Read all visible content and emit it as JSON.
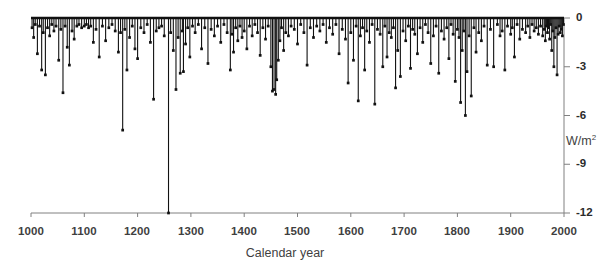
{
  "chart_data": {
    "type": "bar",
    "title": "",
    "subtitle": "",
    "xlabel": "Calendar year",
    "ylabel": "W/m²",
    "xlim": [
      1000,
      2000
    ],
    "ylim": [
      -12,
      0
    ],
    "xticks": [
      1000,
      1100,
      1200,
      1300,
      1400,
      1500,
      1600,
      1700,
      1800,
      1900,
      2000
    ],
    "xtick_labels": [
      "1000",
      "1100",
      "1200",
      "1300",
      "1400",
      "1500",
      "1600",
      "1700",
      "1800",
      "1900",
      "2000"
    ],
    "yticks": [
      0,
      -3,
      -6,
      -9,
      -12
    ],
    "ytick_labels": [
      "0",
      "-3",
      "-6",
      "-9",
      "-12"
    ],
    "grid": false,
    "legend": null,
    "series_name": "Volcanic radiative forcing",
    "marker": "square",
    "marker_color": "#111111",
    "line_color": "#111111",
    "axis_color": "#808080",
    "baseline": 0,
    "x": [
      1002,
      1005,
      1008,
      1012,
      1016,
      1020,
      1023,
      1027,
      1031,
      1035,
      1039,
      1043,
      1047,
      1052,
      1056,
      1060,
      1064,
      1068,
      1072,
      1077,
      1081,
      1086,
      1090,
      1095,
      1100,
      1104,
      1108,
      1112,
      1117,
      1122,
      1128,
      1134,
      1140,
      1146,
      1152,
      1158,
      1164,
      1168,
      1172,
      1176,
      1180,
      1185,
      1190,
      1195,
      1200,
      1206,
      1212,
      1218,
      1224,
      1230,
      1235,
      1240,
      1245,
      1250,
      1258,
      1262,
      1267,
      1272,
      1276,
      1280,
      1284,
      1286,
      1290,
      1294,
      1298,
      1303,
      1308,
      1314,
      1320,
      1326,
      1332,
      1338,
      1344,
      1350,
      1356,
      1362,
      1368,
      1374,
      1377,
      1380,
      1384,
      1388,
      1392,
      1396,
      1400,
      1405,
      1410,
      1415,
      1420,
      1425,
      1430,
      1435,
      1440,
      1445,
      1450,
      1453,
      1456,
      1459,
      1461,
      1464,
      1467,
      1470,
      1474,
      1478,
      1483,
      1488,
      1494,
      1500,
      1506,
      1512,
      1518,
      1524,
      1530,
      1536,
      1542,
      1548,
      1554,
      1560,
      1566,
      1572,
      1578,
      1584,
      1590,
      1595,
      1600,
      1605,
      1610,
      1614,
      1618,
      1622,
      1626,
      1630,
      1635,
      1640,
      1645,
      1650,
      1655,
      1660,
      1664,
      1668,
      1672,
      1676,
      1680,
      1684,
      1688,
      1693,
      1698,
      1703,
      1708,
      1712,
      1716,
      1720,
      1725,
      1730,
      1735,
      1740,
      1745,
      1750,
      1755,
      1760,
      1765,
      1770,
      1775,
      1780,
      1784,
      1788,
      1792,
      1796,
      1800,
      1803,
      1806,
      1809,
      1812,
      1815,
      1818,
      1822,
      1826,
      1831,
      1835,
      1840,
      1845,
      1850,
      1856,
      1862,
      1868,
      1875,
      1880,
      1884,
      1889,
      1894,
      1900,
      1903,
      1907,
      1912,
      1917,
      1922,
      1928,
      1932,
      1936,
      1940,
      1944,
      1948,
      1952,
      1956,
      1960,
      1963,
      1965,
      1967,
      1969,
      1971,
      1973,
      1975,
      1977,
      1979,
      1981,
      1983,
      1985,
      1987,
      1989,
      1991,
      1993,
      1995,
      1997,
      1999
    ],
    "values": [
      -0.6,
      -1.2,
      -0.4,
      -2.2,
      -0.5,
      -3.2,
      -0.9,
      -3.5,
      -0.6,
      -1.1,
      -0.4,
      -0.8,
      -0.5,
      -2.6,
      -0.7,
      -4.6,
      -0.5,
      -1.8,
      -2.9,
      -0.8,
      -1.3,
      -0.5,
      -0.4,
      -0.6,
      -0.5,
      -0.4,
      -0.6,
      -0.5,
      -1.5,
      -0.7,
      -2.4,
      -0.5,
      -1.4,
      -0.6,
      -0.4,
      -0.8,
      -2.1,
      -0.9,
      -6.9,
      -0.7,
      -3.2,
      -1.2,
      -0.5,
      -1.9,
      -2.5,
      -0.6,
      -0.9,
      -0.4,
      -1.5,
      -5.0,
      -0.8,
      -0.6,
      -0.5,
      -1.1,
      -12.0,
      -0.9,
      -2.0,
      -4.4,
      -1.2,
      -3.4,
      -0.8,
      -3.3,
      -1.6,
      -0.6,
      -2.4,
      -0.5,
      -0.9,
      -0.4,
      -1.9,
      -0.6,
      -2.8,
      -0.7,
      -1.1,
      -0.5,
      -1.5,
      -0.4,
      -0.9,
      -3.2,
      -1.0,
      -2.1,
      -0.6,
      -1.4,
      -0.5,
      -1.2,
      -0.8,
      -1.9,
      -0.5,
      -1.1,
      -0.4,
      -0.9,
      -2.3,
      -0.6,
      -1.3,
      -0.5,
      -3.0,
      -4.5,
      -4.4,
      -4.7,
      -3.8,
      -2.6,
      -1.4,
      -0.6,
      -2.0,
      -0.9,
      -1.1,
      -0.5,
      -0.7,
      -1.6,
      -0.4,
      -0.9,
      -2.9,
      -0.6,
      -1.2,
      -0.5,
      -0.8,
      -0.4,
      -1.5,
      -0.6,
      -1.0,
      -0.4,
      -2.2,
      -0.7,
      -1.3,
      -4.0,
      -0.9,
      -2.6,
      -0.5,
      -5.1,
      -1.1,
      -0.6,
      -3.2,
      -0.8,
      -1.5,
      -0.4,
      -5.3,
      -0.7,
      -1.0,
      -3.0,
      -0.5,
      -2.4,
      -0.9,
      -1.2,
      -0.6,
      -4.3,
      -2.0,
      -3.6,
      -0.8,
      -1.4,
      -0.5,
      -3.1,
      -0.7,
      -1.0,
      -2.2,
      -0.6,
      -1.5,
      -0.4,
      -0.9,
      -2.8,
      -1.1,
      -0.5,
      -3.4,
      -0.8,
      -1.3,
      -0.6,
      -2.5,
      -0.4,
      -1.0,
      -3.9,
      -0.7,
      -1.2,
      -5.2,
      -2.0,
      -0.8,
      -6.0,
      -3.3,
      -1.1,
      -4.8,
      -0.6,
      -2.1,
      -0.9,
      -1.4,
      -0.5,
      -2.9,
      -0.7,
      -3.0,
      -0.4,
      -1.1,
      -0.8,
      -3.2,
      -0.5,
      -1.0,
      -0.6,
      -2.4,
      -0.4,
      -1.3,
      -0.7,
      -0.9,
      -0.5,
      -1.2,
      -0.4,
      -0.8,
      -0.6,
      -1.0,
      -0.5,
      -1.1,
      -0.7,
      -1.4,
      -0.5,
      -0.9,
      -0.6,
      -1.3,
      -0.4,
      -2.0,
      -0.8,
      -3.0,
      -1.2,
      -0.6,
      -3.5,
      -1.0,
      -0.5,
      -0.9,
      -0.7,
      -1.1,
      -0.4
    ]
  },
  "axes": {
    "x_axis_name": "calendar-year-axis",
    "y_axis_name": "forcing-axis"
  }
}
